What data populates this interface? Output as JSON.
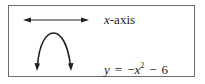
{
  "legend": {
    "items": [
      {
        "icon": "double-headed-arrow-icon",
        "label_var": "x",
        "label_rest": "-axis"
      },
      {
        "icon": "downward-parabola-icon",
        "eq_lhs": "y",
        "eq_equals": "=",
        "eq_neg": "−",
        "eq_var": "x",
        "eq_exp": "2",
        "eq_minus": "−",
        "eq_const": "6"
      }
    ]
  },
  "colors": {
    "stroke": "#222222",
    "border": "#6a6a6a",
    "background": "#ffffff"
  }
}
